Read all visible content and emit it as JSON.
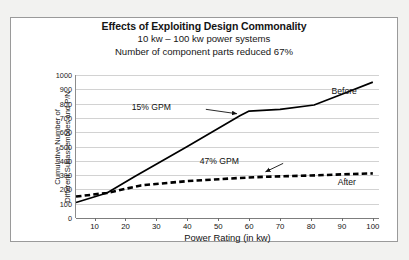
{
  "figure": {
    "title": "Effects of Exploiting Design Commonality",
    "subtitle_1": "10 kw – 100 kw power systems",
    "subtitle_2": "Number of component parts reduced 67%"
  },
  "chart_data": {
    "type": "line",
    "title": "Effects of Exploiting Design Commonality",
    "subtitle": "10 kw – 100 kw power systems / Number of component parts reduced 67%",
    "xlabel": "Power Rating (in kw)",
    "ylabel": "Cumulative Number of Different Subassemblies and P/N",
    "ylabel_line_1": "Cumulative Number of",
    "ylabel_line_2": "Different Subassemblies and P/N",
    "xlim": [
      4,
      102
    ],
    "ylim": [
      0,
      1000
    ],
    "xticks": [
      10,
      20,
      30,
      40,
      50,
      60,
      70,
      80,
      90,
      100
    ],
    "yticks": [
      0,
      100,
      200,
      300,
      400,
      500,
      600,
      700,
      800,
      900,
      1000
    ],
    "grid": "horizontal",
    "legend": "inline-labels",
    "series": [
      {
        "name": "Before",
        "style": "solid",
        "color": "#000000",
        "x": [
          4,
          14,
          23,
          40,
          57,
          60,
          70,
          81,
          90,
          100
        ],
        "values": [
          108,
          175,
          290,
          500,
          715,
          748,
          760,
          790,
          865,
          950
        ]
      },
      {
        "name": "After",
        "style": "dashed",
        "color": "#000000",
        "x": [
          4,
          14,
          25,
          40,
          57,
          65,
          80,
          90,
          100
        ],
        "values": [
          150,
          175,
          228,
          258,
          280,
          288,
          297,
          305,
          312
        ]
      }
    ],
    "annotations": [
      {
        "text": "15% GPM",
        "target_series": "Before",
        "target_x": 57,
        "target_y": 715
      },
      {
        "text": "47% GPM",
        "target_series": "After",
        "target_x": 65,
        "target_y": 288
      }
    ],
    "series_labels": [
      {
        "text": "Before",
        "series": "Before"
      },
      {
        "text": "After",
        "series": "After"
      }
    ]
  }
}
